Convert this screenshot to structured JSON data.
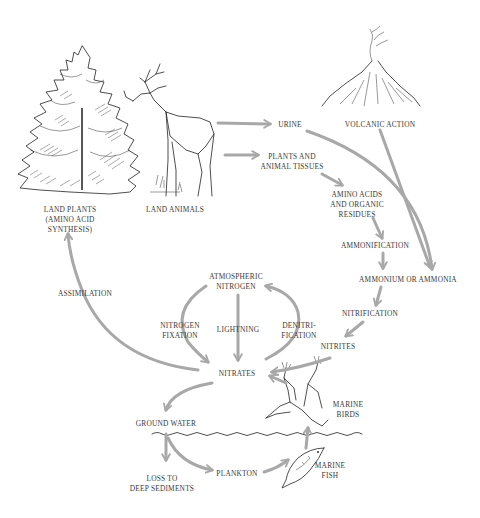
{
  "nodes": {
    "land_plants": "LAND PLANTS\n(AMINO ACID\nSYNTHESIS)",
    "land_animals": "LAND ANIMALS",
    "urine": "URINE",
    "volcanic_action": "VOLCANIC ACTION",
    "plants_animal_tissues": "PLANTS AND\nANIMAL TISSUES",
    "amino_acids": "AMINO ACIDS\nAND ORGANIC\nRESIDUES",
    "ammonification": "AMMONIFICATION",
    "ammonium": "AMMONIUM OR AMMONIA",
    "nitrification": "NITRIFICATION",
    "nitrites": "NITRITES",
    "atmospheric_nitrogen": "ATMOSPHERIC\nNITROGEN",
    "nitrogen_fixation": "NITROGEN\nFIXATION",
    "lightning": "LIGHTNING",
    "denitrification": "DENITRI-\nFICATION",
    "nitrates": "NITRATES",
    "assimilation": "ASSIMILATION",
    "ground_water": "GROUND WATER",
    "loss_deep_sediments": "LOSS TO\nDEEP SEDIMENTS",
    "plankton": "PLANKTON",
    "marine_birds": "MARINE\nBIRDS",
    "marine_fish": "MARINE\nFISH"
  },
  "edges": [
    {
      "from": "land_animals",
      "to": "urine"
    },
    {
      "from": "land_animals",
      "to": "plants_animal_tissues"
    },
    {
      "from": "plants_animal_tissues",
      "to": "amino_acids"
    },
    {
      "from": "amino_acids",
      "to": "ammonification"
    },
    {
      "from": "ammonification",
      "to": "ammonium"
    },
    {
      "from": "urine",
      "to": "ammonium"
    },
    {
      "from": "volcanic_action",
      "to": "ammonium"
    },
    {
      "from": "ammonium",
      "to": "nitrification"
    },
    {
      "from": "nitrification",
      "to": "nitrites"
    },
    {
      "from": "nitrites",
      "to": "nitrates"
    },
    {
      "from": "atmospheric_nitrogen",
      "to": "nitrates",
      "label": "lightning"
    },
    {
      "from": "atmospheric_nitrogen",
      "to": "nitrates",
      "label": "nitrogen_fixation"
    },
    {
      "from": "nitrates",
      "to": "atmospheric_nitrogen",
      "label": "denitrification"
    },
    {
      "from": "nitrates",
      "to": "land_plants",
      "label": "assimilation"
    },
    {
      "from": "nitrates",
      "to": "ground_water"
    },
    {
      "from": "ground_water",
      "to": "loss_deep_sediments"
    },
    {
      "from": "ground_water",
      "to": "plankton"
    },
    {
      "from": "plankton",
      "to": "marine_fish"
    },
    {
      "from": "marine_fish",
      "to": "marine_birds"
    },
    {
      "from": "marine_birds",
      "to": "nitrates"
    }
  ],
  "colors": {
    "arrow": "#a8a8a8",
    "ink": "#222222",
    "text": "#3a3a3a"
  }
}
